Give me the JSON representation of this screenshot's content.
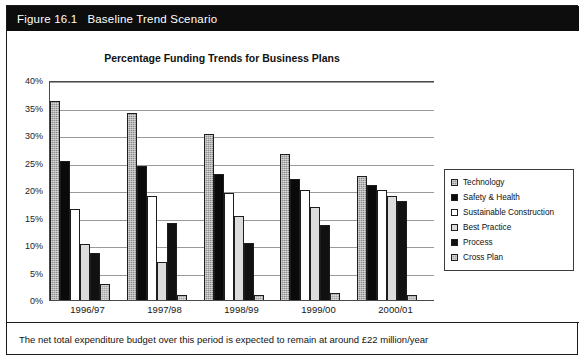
{
  "figure": {
    "number": "Figure 16.1",
    "name": "Baseline Trend Scenario"
  },
  "footer": {
    "note": "The net total expenditure budget over this period is expected to remain at around £22 million/year"
  },
  "legend": {
    "position": "right",
    "items": [
      {
        "label": "Technology",
        "swatch": "gray-hatched-swatch"
      },
      {
        "label": "Safety & Health",
        "swatch": "black-solid-swatch"
      },
      {
        "label": "Sustainable Construction",
        "swatch": "white-swatch"
      },
      {
        "label": "Best Practice",
        "swatch": "light-gray-swatch"
      },
      {
        "label": "Process",
        "swatch": "black-solid-swatch"
      },
      {
        "label": "Cross Plan",
        "swatch": "gray-swatch"
      }
    ]
  },
  "yaxis": {
    "ticks": [
      "40%",
      "35%",
      "30%",
      "25%",
      "20%",
      "15%",
      "10%",
      "5%",
      "0%"
    ]
  },
  "chart_data": {
    "type": "bar",
    "title": "Percentage Funding Trends for Business Plans",
    "xlabel": "",
    "ylabel": "",
    "ylim": [
      0,
      40
    ],
    "ytick_step": 5,
    "grid": true,
    "legend_position": "right",
    "categories": [
      "1996/97",
      "1997/98",
      "1998/99",
      "1999/00",
      "2000/01"
    ],
    "series": [
      {
        "name": "Technology",
        "values": [
          36.2,
          34.0,
          30.2,
          26.5,
          22.5
        ]
      },
      {
        "name": "Safety & Health",
        "values": [
          25.2,
          24.3,
          23.0,
          22.0,
          21.0
        ]
      },
      {
        "name": "Sustainable Construction",
        "values": [
          16.5,
          19.0,
          19.5,
          20.0,
          20.0
        ]
      },
      {
        "name": "Best Practice",
        "values": [
          10.2,
          7.0,
          15.3,
          17.0,
          19.0
        ]
      },
      {
        "name": "Process",
        "values": [
          8.5,
          14.0,
          10.3,
          13.7,
          18.0
        ]
      },
      {
        "name": "Cross Plan",
        "values": [
          3.0,
          1.0,
          1.0,
          1.3,
          1.0
        ]
      }
    ]
  }
}
